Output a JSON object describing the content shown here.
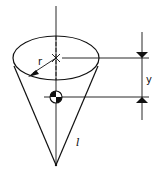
{
  "diagram": {
    "labels": {
      "radius": "r",
      "height_offset": "y",
      "slant_length": "l"
    },
    "colors": {
      "line": "#111111",
      "background": "#ffffff"
    }
  }
}
